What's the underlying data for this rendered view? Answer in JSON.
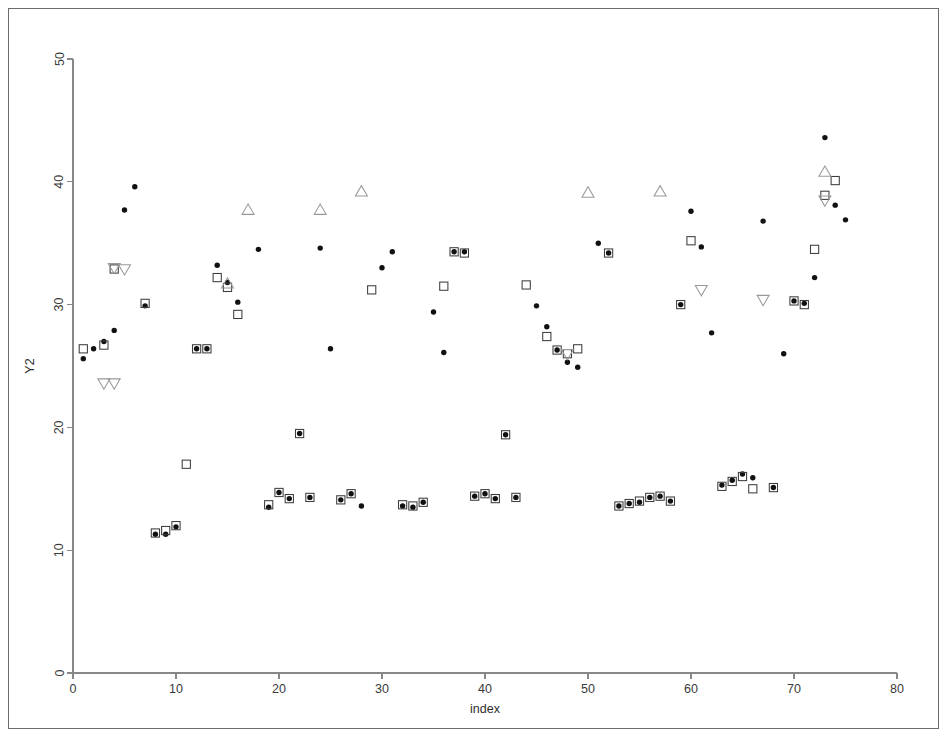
{
  "figure": {
    "background_color": "#ffffff",
    "frame_color": "#6b6b6b",
    "axis_color": "#888888"
  },
  "axes": {
    "x_title": "index",
    "y_title": "Y2",
    "x_ticks": [
      "0",
      "10",
      "20",
      "30",
      "40",
      "50",
      "60",
      "70",
      "80"
    ],
    "y_ticks": [
      "0",
      "10",
      "20",
      "30",
      "40",
      "50"
    ]
  },
  "chart_data": {
    "type": "scatter",
    "title": "",
    "xlabel": "index",
    "ylabel": "Y2",
    "xlim": [
      0,
      80
    ],
    "ylim": [
      0,
      50
    ],
    "xticks": [
      0,
      10,
      20,
      30,
      40,
      50,
      60,
      70,
      80
    ],
    "yticks": [
      0,
      10,
      20,
      30,
      40,
      50
    ],
    "grid": false,
    "legend": "none",
    "marker_styles": {
      "circle": "filled-black-circle",
      "square": "open-square",
      "triangle_up": "open-up-triangle",
      "triangle_down": "open-down-triangle"
    },
    "series": [
      {
        "name": "circle",
        "marker": "circle",
        "color": "#111111",
        "points": [
          [
            1,
            25.6
          ],
          [
            2,
            26.4
          ],
          [
            3,
            27.0
          ],
          [
            4,
            27.9
          ],
          [
            5,
            37.7
          ],
          [
            6,
            39.6
          ],
          [
            7,
            29.9
          ],
          [
            8,
            11.3
          ],
          [
            9,
            11.3
          ],
          [
            10,
            11.9
          ],
          [
            12,
            26.4
          ],
          [
            13,
            26.4
          ],
          [
            14,
            33.2
          ],
          [
            15,
            31.8
          ],
          [
            16,
            30.2
          ],
          [
            18,
            34.5
          ],
          [
            19,
            13.5
          ],
          [
            20,
            14.7
          ],
          [
            21,
            14.2
          ],
          [
            22,
            19.5
          ],
          [
            23,
            14.3
          ],
          [
            24,
            34.6
          ],
          [
            25,
            26.4
          ],
          [
            26,
            14.1
          ],
          [
            27,
            14.6
          ],
          [
            28,
            13.6
          ],
          [
            30,
            33.0
          ],
          [
            31,
            34.3
          ],
          [
            32,
            13.6
          ],
          [
            33,
            13.5
          ],
          [
            34,
            13.9
          ],
          [
            35,
            29.4
          ],
          [
            36,
            26.1
          ],
          [
            37,
            34.3
          ],
          [
            38,
            34.3
          ],
          [
            39,
            14.4
          ],
          [
            40,
            14.6
          ],
          [
            41,
            14.2
          ],
          [
            42,
            19.4
          ],
          [
            43,
            14.3
          ],
          [
            45,
            29.9
          ],
          [
            46,
            28.2
          ],
          [
            47,
            26.3
          ],
          [
            48,
            25.3
          ],
          [
            49,
            24.9
          ],
          [
            51,
            35.0
          ],
          [
            52,
            34.2
          ],
          [
            53,
            13.6
          ],
          [
            54,
            13.8
          ],
          [
            55,
            13.9
          ],
          [
            56,
            14.3
          ],
          [
            57,
            14.4
          ],
          [
            58,
            14.0
          ],
          [
            59,
            30.0
          ],
          [
            60,
            37.6
          ],
          [
            61,
            34.7
          ],
          [
            62,
            27.7
          ],
          [
            63,
            15.3
          ],
          [
            64,
            15.7
          ],
          [
            65,
            16.2
          ],
          [
            66,
            15.9
          ],
          [
            67,
            36.8
          ],
          [
            68,
            15.1
          ],
          [
            69,
            26.0
          ],
          [
            70,
            30.3
          ],
          [
            71,
            30.1
          ],
          [
            72,
            32.2
          ],
          [
            73,
            43.6
          ],
          [
            74,
            38.1
          ],
          [
            75,
            36.9
          ]
        ]
      },
      {
        "name": "square",
        "marker": "square",
        "color": "#3d3d3d",
        "points": [
          [
            1,
            26.4
          ],
          [
            3,
            26.7
          ],
          [
            4,
            32.9
          ],
          [
            7,
            30.1
          ],
          [
            8,
            11.4
          ],
          [
            9,
            11.6
          ],
          [
            10,
            12.0
          ],
          [
            11,
            17.0
          ],
          [
            12,
            26.4
          ],
          [
            13,
            26.4
          ],
          [
            14,
            32.2
          ],
          [
            15,
            31.4
          ],
          [
            16,
            29.2
          ],
          [
            19,
            13.7
          ],
          [
            20,
            14.7
          ],
          [
            21,
            14.2
          ],
          [
            22,
            19.5
          ],
          [
            23,
            14.3
          ],
          [
            26,
            14.1
          ],
          [
            27,
            14.6
          ],
          [
            29,
            31.2
          ],
          [
            32,
            13.7
          ],
          [
            33,
            13.6
          ],
          [
            34,
            13.9
          ],
          [
            36,
            31.5
          ],
          [
            37,
            34.3
          ],
          [
            38,
            34.2
          ],
          [
            39,
            14.4
          ],
          [
            40,
            14.6
          ],
          [
            41,
            14.2
          ],
          [
            42,
            19.4
          ],
          [
            43,
            14.3
          ],
          [
            44,
            31.6
          ],
          [
            46,
            27.4
          ],
          [
            47,
            26.3
          ],
          [
            48,
            26.0
          ],
          [
            49,
            26.4
          ],
          [
            52,
            34.2
          ],
          [
            53,
            13.6
          ],
          [
            54,
            13.8
          ],
          [
            55,
            14.0
          ],
          [
            56,
            14.3
          ],
          [
            57,
            14.4
          ],
          [
            58,
            14.0
          ],
          [
            59,
            30.0
          ],
          [
            60,
            35.2
          ],
          [
            63,
            15.2
          ],
          [
            64,
            15.6
          ],
          [
            65,
            16.0
          ],
          [
            66,
            15.0
          ],
          [
            68,
            15.1
          ],
          [
            70,
            30.3
          ],
          [
            71,
            30.0
          ],
          [
            72,
            34.5
          ],
          [
            73,
            38.9
          ],
          [
            74,
            40.1
          ]
        ]
      },
      {
        "name": "triangle_up",
        "marker": "triangle_up",
        "color": "#999999",
        "points": [
          [
            15,
            31.7
          ],
          [
            17,
            37.7
          ],
          [
            24,
            37.7
          ],
          [
            28,
            39.2
          ],
          [
            50,
            39.1
          ],
          [
            57,
            39.2
          ],
          [
            73,
            40.8
          ]
        ]
      },
      {
        "name": "triangle_down",
        "marker": "triangle_down",
        "color": "#999999",
        "points": [
          [
            3,
            23.6
          ],
          [
            4,
            23.6
          ],
          [
            4,
            33.0
          ],
          [
            5,
            32.9
          ],
          [
            48,
            26.0
          ],
          [
            61,
            31.2
          ],
          [
            67,
            30.4
          ],
          [
            73,
            38.5
          ]
        ]
      }
    ]
  }
}
